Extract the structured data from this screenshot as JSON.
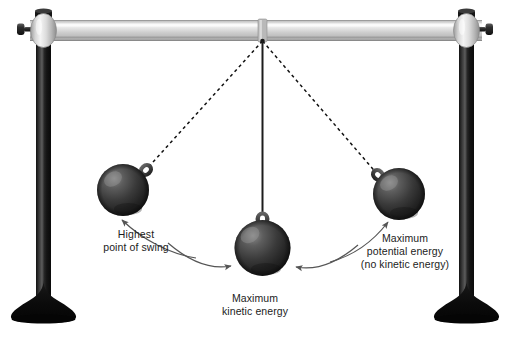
{
  "figure": {
    "background_color": "#ffffff"
  },
  "labels": {
    "highest_point": {
      "line1": "Highest",
      "line2": "point of swing"
    },
    "max_kinetic": {
      "line1": "Maximum",
      "line2": "kinetic energy"
    },
    "max_potential": {
      "line1": "Maximum",
      "line2": "potential energy",
      "line3": "(no kinetic energy)"
    }
  },
  "colors": {
    "bar_light": "#e8e8e8",
    "bar_mid": "#c9c9c9",
    "bar_dark": "#9a9a9a",
    "pole_dark": "#151515",
    "pole_highlight": "#4a4a4a",
    "base_black": "#080808",
    "clamp_light": "#f0f0f0",
    "clamp_mid": "#c4c4c4",
    "clamp_dark": "#8e8e8e",
    "bob_dark": "#2b2b2b",
    "bob_light": "#6d6d6d",
    "string": "#202020",
    "dashed_line": "#111111",
    "arrow": "#555555",
    "text": "#1c1c1c"
  },
  "elements": {
    "left_stand": "left-vertical-pole",
    "right_stand": "right-vertical-pole",
    "cross_bar": "horizontal-support-bar",
    "pivot": "pendulum-pivot-point",
    "bob_left": "pendulum-bob-left-extreme",
    "bob_center": "pendulum-bob-lowest-point",
    "bob_right": "pendulum-bob-right-extreme",
    "string_center": "pendulum-string-solid",
    "string_left": "pendulum-string-dashed-left",
    "string_right": "pendulum-string-dashed-right"
  }
}
